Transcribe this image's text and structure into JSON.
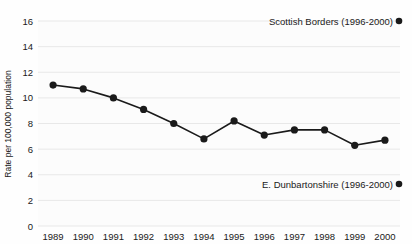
{
  "chart_data": {
    "type": "line",
    "title": "",
    "subtitle": "",
    "xlabel": "",
    "ylabel": "Rate per 100,000 population",
    "categories": [
      "1989",
      "1990",
      "1991",
      "1992",
      "1993",
      "1994",
      "1995",
      "1996",
      "1997",
      "1998",
      "1999",
      "2000"
    ],
    "series": [
      {
        "name": "Rate per 100,000 population",
        "values": [
          11.0,
          10.7,
          10.0,
          9.1,
          8.0,
          6.8,
          8.2,
          7.1,
          7.5,
          7.5,
          6.3,
          6.7
        ],
        "color": "#1a1a1a",
        "marker": "filled-circle"
      }
    ],
    "ylim": [
      0,
      16
    ],
    "yticks": [
      0,
      2,
      4,
      6,
      8,
      10,
      12,
      14,
      16
    ],
    "ytick_labels": [
      "0",
      "2",
      "4",
      "6",
      "8",
      "10",
      "12",
      "14",
      "16"
    ],
    "xtick_labels": [
      "1989",
      "1990",
      "1991",
      "1992",
      "1993",
      "1994",
      "1995",
      "1996",
      "1997",
      "1998",
      "1999",
      "2000"
    ],
    "grid": true,
    "grid_axis": "y",
    "grid_color": "#e8e8e8",
    "legend_position": "inside-right",
    "annotations": [
      {
        "id": "scottish-borders",
        "label": "Scottish Borders (1996-2000)",
        "marker": "filled-circle",
        "marker_color": "#1a1a1a",
        "x_value": 2000,
        "y_value": 15.2
      },
      {
        "id": "e-dunbartonshire",
        "label": "E. Dunbartonshire (1996-2000)",
        "marker": "filled-circle",
        "marker_color": "#1a1a1a",
        "x_value": 2000,
        "y_value": 3.0
      }
    ]
  },
  "axes": {
    "y_title": "Rate per 100,000 population",
    "y_labels": [
      "16",
      "14",
      "12",
      "10",
      "8",
      "6",
      "4",
      "2",
      "0"
    ],
    "x_labels": [
      "1989",
      "1990",
      "1991",
      "1992",
      "1993",
      "1994",
      "1995",
      "1996",
      "1997",
      "1998",
      "1999",
      "2000"
    ]
  },
  "legend": {
    "top_label": "Scottish Borders (1996-2000)",
    "bottom_label": "E. Dunbartonshire (1996-2000)"
  },
  "colors": {
    "line": "#1a1a1a",
    "marker": "#1a1a1a",
    "grid": "#e8e8e8",
    "text": "#1a1a1a",
    "background": "#fefefe"
  }
}
